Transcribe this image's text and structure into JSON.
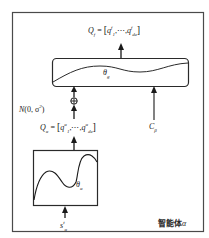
{
  "figure": {
    "frame_label": {
      "prefix": "智能体",
      "symbol": "α"
    },
    "colors": {
      "stroke": "#3a3a3a",
      "text": "#1a1a1a",
      "background": "#ffffff"
    },
    "output_q_f": {
      "lhs": "Q",
      "lhs_sub": "f",
      "eq": " = ",
      "open": "[",
      "first": "q",
      "first_sub": "1",
      "first_sup": "f",
      "ellipsis": ",⋯,",
      "last": "q",
      "last_sub": "d",
      "last_sub_sub": "a",
      "last_sup": "f",
      "close": "]"
    },
    "global_network": {
      "param": "θ",
      "param_sub": "g"
    },
    "noise": {
      "text": "N(0, σ²)",
      "prefix": "N",
      "args": "(0, σ",
      "sup": "2",
      "close": ")"
    },
    "combine_op": "⊕",
    "q_alpha": {
      "lhs": "Q",
      "lhs_sub": "α",
      "eq": " = ",
      "open": "[",
      "first": "q",
      "first_sub": "1",
      "first_sup": "α",
      "ellipsis": ",⋯,",
      "last": "q",
      "last_sub": "d",
      "last_sub_sub": "a",
      "last_sup": "α",
      "close": "]"
    },
    "context_input": {
      "symbol": "C",
      "sub": "β"
    },
    "local_network": {
      "param": "θ",
      "param_sub": "α"
    },
    "state_input": {
      "symbol": "s",
      "sub": "α",
      "sup": "t"
    }
  }
}
